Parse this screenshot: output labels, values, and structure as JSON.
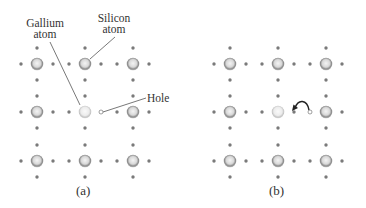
{
  "figure": {
    "panels": [
      {
        "id": "a",
        "caption": "(a)"
      },
      {
        "id": "b",
        "caption": "(b)"
      }
    ],
    "labels": {
      "gallium": {
        "line1": "Gallium",
        "line2": "atom"
      },
      "silicon": {
        "line1": "Silicon",
        "line2": "atom"
      },
      "hole": "Hole"
    },
    "lattice": {
      "rows": 3,
      "cols": 3,
      "center_atom": "Gallium",
      "other_atoms": "Silicon"
    },
    "colors": {
      "atom_ring": "#8a8a8a",
      "atom_center": "#f0f0f0",
      "gallium_ring": "#c8c8c8",
      "electron_dot": "#7a7a7a",
      "line": "#555555"
    }
  }
}
